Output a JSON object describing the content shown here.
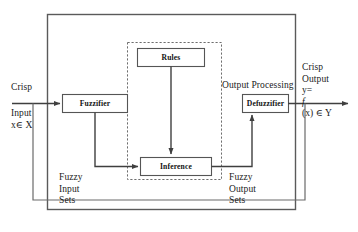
{
  "diagram": {
    "colors": {
      "line": "#4a4a4a",
      "box_border": "#555555",
      "text": "#1a1a1a",
      "background": "#ffffff"
    },
    "outer_boundary": {
      "name": "fuzzy-inference-system-boundary",
      "style": "solid"
    },
    "inner_boundary": {
      "name": "fuzzy-inference-engine-boundary",
      "style": "dashed"
    },
    "blocks": {
      "fuzzifier": "Fuzzifier",
      "rules": "Rules",
      "inference": "Inference",
      "defuzzifier": "Defuzzifier"
    },
    "labels": {
      "output_processing": "Output Processing",
      "crisp_input": {
        "line1": "Crisp",
        "line2": "Input",
        "line3": "x∈ X"
      },
      "crisp_output": {
        "line1": "Crisp",
        "line2": "Output",
        "line3_prefix": "y=",
        "line3_italic": "f",
        "line3_suffix": "(x) ∈ Y"
      },
      "fuzzy_input_sets": {
        "line1": "Fuzzy",
        "line2": "Input",
        "line3": "Sets"
      },
      "fuzzy_output_sets": {
        "line1": "Fuzzy",
        "line2": "Output",
        "line3": "Sets"
      }
    }
  }
}
